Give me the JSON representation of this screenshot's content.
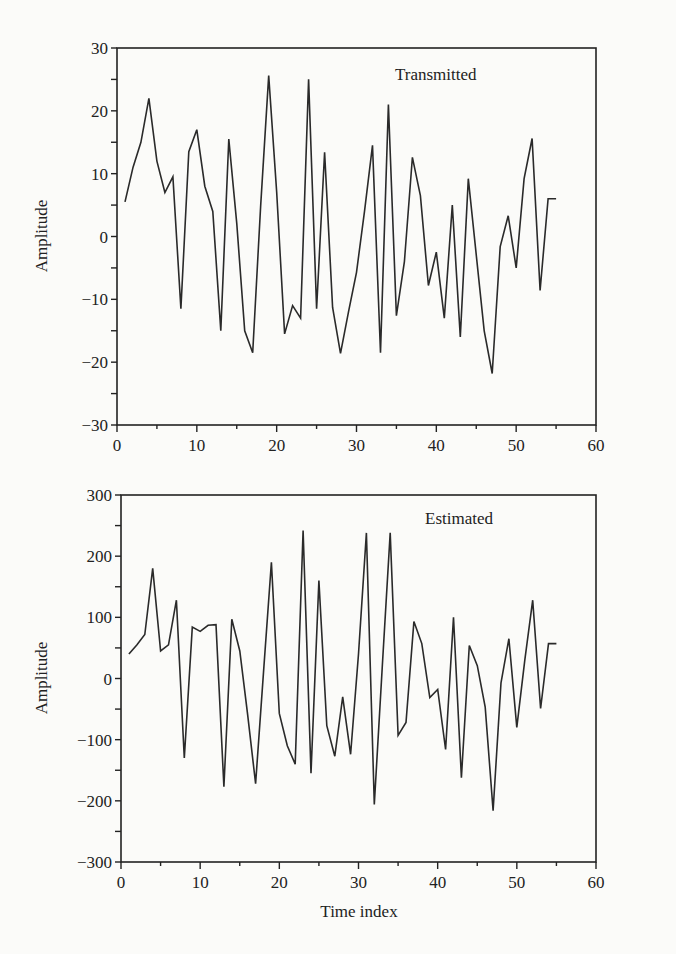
{
  "chart_data": [
    {
      "type": "line",
      "title": "Transmitted",
      "xlabel": "",
      "ylabel": "Amplitude",
      "xlim": [
        0,
        60
      ],
      "ylim": [
        -30,
        30
      ],
      "xticks": [
        0,
        10,
        20,
        30,
        40,
        50,
        60
      ],
      "yticks": [
        -30,
        -20,
        -10,
        0,
        10,
        20,
        30
      ],
      "grid": false,
      "x": [
        1,
        2,
        3,
        4,
        5,
        6,
        7,
        8,
        9,
        10,
        11,
        12,
        13,
        14,
        15,
        16,
        17,
        18,
        19,
        20,
        21,
        22,
        23,
        24,
        25,
        26,
        27,
        28,
        29,
        30,
        31,
        32,
        33,
        34,
        35,
        36,
        37,
        38,
        39,
        40,
        41,
        42,
        43,
        44,
        45,
        46,
        47,
        48,
        49,
        50,
        51,
        52,
        53,
        54,
        55
      ],
      "series": [
        {
          "name": "Transmitted",
          "values": [
            5.5,
            11,
            15,
            22,
            12,
            7,
            9.5,
            -11.5,
            13.5,
            17,
            8,
            4,
            -15,
            15.5,
            2,
            -15,
            -18.5,
            5,
            25.6,
            7,
            -15.5,
            -11,
            -13,
            25,
            -11.5,
            13.4,
            -11.3,
            -18.6,
            -12,
            -5.7,
            4,
            14.5,
            -18.5,
            21,
            -12.6,
            -4,
            12.6,
            6.5,
            -7.8,
            -2.5,
            -13,
            5,
            -16,
            9.2,
            -3,
            -15,
            -21.8,
            -1.6,
            3.3,
            -5,
            9.2,
            15.6,
            -8.6,
            6,
            6
          ]
        }
      ]
    },
    {
      "type": "line",
      "title": "Estimated",
      "xlabel": "Time index",
      "ylabel": "Amplitude",
      "xlim": [
        0,
        60
      ],
      "ylim": [
        -300,
        300
      ],
      "xticks": [
        0,
        10,
        20,
        30,
        40,
        50,
        60
      ],
      "yticks": [
        -300,
        -200,
        -100,
        0,
        100,
        200,
        300
      ],
      "grid": false,
      "x": [
        1,
        2,
        3,
        4,
        5,
        6,
        7,
        8,
        9,
        10,
        11,
        12,
        13,
        14,
        15,
        16,
        17,
        18,
        19,
        20,
        21,
        22,
        23,
        24,
        25,
        26,
        27,
        28,
        29,
        30,
        31,
        32,
        33,
        34,
        35,
        36,
        37,
        38,
        39,
        40,
        41,
        42,
        43,
        44,
        45,
        46,
        47,
        48,
        49,
        50,
        51,
        52,
        53,
        54,
        55
      ],
      "series": [
        {
          "name": "Estimated",
          "values": [
            40,
            55,
            72,
            180,
            45,
            55,
            128,
            -130,
            84,
            77,
            87,
            88,
            -177,
            97,
            45,
            -60,
            -172,
            10,
            190,
            -57,
            -110,
            -140,
            242,
            -155,
            160,
            -77,
            -127,
            -30,
            -124,
            40,
            238,
            -206,
            20,
            238,
            -93,
            -72,
            93,
            57,
            -31,
            -18,
            -116,
            100,
            -162,
            54,
            21,
            -47,
            -216,
            -7,
            65,
            -80,
            30,
            128,
            -49,
            57,
            57
          ]
        }
      ]
    }
  ],
  "charts": {
    "top": {
      "legend": "Transmitted",
      "ylabel": "Amplitude",
      "yticks": [
        "30",
        "20",
        "10",
        "0",
        "−10",
        "−20",
        "−30"
      ],
      "xticks": [
        "0",
        "10",
        "20",
        "30",
        "40",
        "50",
        "60"
      ]
    },
    "bottom": {
      "legend": "Estimated",
      "ylabel": "Amplitude",
      "xlabel": "Time index",
      "yticks": [
        "300",
        "200",
        "100",
        "0",
        "−100",
        "−200",
        "−300"
      ],
      "xticks": [
        "0",
        "10",
        "20",
        "30",
        "40",
        "50",
        "60"
      ]
    }
  },
  "colors": {
    "line": "#2a2a2a",
    "axis": "#222222",
    "background": "#fbfbf9"
  }
}
